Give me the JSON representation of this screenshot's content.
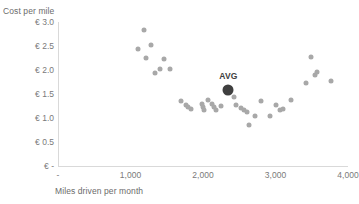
{
  "chart_data": {
    "type": "scatter",
    "title": "",
    "xlabel": "Miles driven per month",
    "ylabel": "Cost per mile",
    "xlim": [
      0,
      4000
    ],
    "ylim": [
      0,
      3.0
    ],
    "grid": false,
    "legend": null,
    "x_ticks": [
      {
        "value": 0,
        "label": "-"
      },
      {
        "value": 1000,
        "label": "1,000"
      },
      {
        "value": 2000,
        "label": "2,000"
      },
      {
        "value": 3000,
        "label": "3,000"
      },
      {
        "value": 4000,
        "label": "4,000"
      }
    ],
    "y_ticks": [
      {
        "value": 0,
        "label": "€ -"
      },
      {
        "value": 0.5,
        "label": "€ 0.5"
      },
      {
        "value": 1.0,
        "label": "€ 1.0"
      },
      {
        "value": 1.5,
        "label": "€ 1.5"
      },
      {
        "value": 2.0,
        "label": "€ 2.0"
      },
      {
        "value": 2.5,
        "label": "€ 2.5"
      },
      {
        "value": 3.0,
        "label": "€ 3.0"
      }
    ],
    "point_color": "#a8a8a8",
    "highlight_color": "#3f3f3f",
    "series": [
      {
        "name": "vehicles",
        "points": [
          {
            "x": 1180,
            "y": 2.83
          },
          {
            "x": 1100,
            "y": 2.44
          },
          {
            "x": 1280,
            "y": 2.53
          },
          {
            "x": 1210,
            "y": 2.25
          },
          {
            "x": 1460,
            "y": 2.22
          },
          {
            "x": 1400,
            "y": 2.02
          },
          {
            "x": 1340,
            "y": 1.93
          },
          {
            "x": 1550,
            "y": 2.02
          },
          {
            "x": 1700,
            "y": 1.36
          },
          {
            "x": 1760,
            "y": 1.28
          },
          {
            "x": 1790,
            "y": 1.22
          },
          {
            "x": 1830,
            "y": 1.18
          },
          {
            "x": 1990,
            "y": 1.29
          },
          {
            "x": 2000,
            "y": 1.22
          },
          {
            "x": 2010,
            "y": 1.17
          },
          {
            "x": 2070,
            "y": 1.37
          },
          {
            "x": 2120,
            "y": 1.3
          },
          {
            "x": 2150,
            "y": 1.22
          },
          {
            "x": 2180,
            "y": 1.17
          },
          {
            "x": 2250,
            "y": 1.25
          },
          {
            "x": 2430,
            "y": 1.44
          },
          {
            "x": 2450,
            "y": 1.27
          },
          {
            "x": 2520,
            "y": 1.2
          },
          {
            "x": 2570,
            "y": 1.16
          },
          {
            "x": 2610,
            "y": 1.13
          },
          {
            "x": 2640,
            "y": 0.86
          },
          {
            "x": 2720,
            "y": 1.05
          },
          {
            "x": 2800,
            "y": 1.36
          },
          {
            "x": 2930,
            "y": 1.04
          },
          {
            "x": 3010,
            "y": 1.27
          },
          {
            "x": 3060,
            "y": 1.16
          },
          {
            "x": 3100,
            "y": 1.19
          },
          {
            "x": 3210,
            "y": 1.38
          },
          {
            "x": 3420,
            "y": 1.72
          },
          {
            "x": 3490,
            "y": 2.28
          },
          {
            "x": 3540,
            "y": 1.9
          },
          {
            "x": 3570,
            "y": 1.96
          },
          {
            "x": 3760,
            "y": 1.78
          }
        ]
      }
    ],
    "annotations": [
      {
        "label": "AVG",
        "x": 2350,
        "y": 1.58,
        "highlight": true
      }
    ]
  }
}
